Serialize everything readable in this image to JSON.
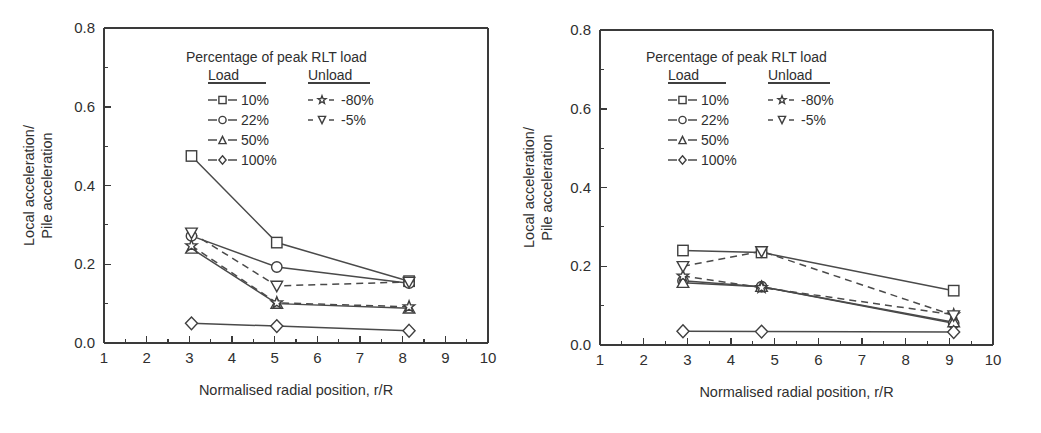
{
  "figure": {
    "background": "#ffffff",
    "line_color": "#4a4a4a",
    "marker_fill": "#ffffff",
    "marker_stroke": "#3f3f3f",
    "text_color": "#2f2f2f"
  },
  "legend": {
    "title": "Percentage of peak RLT load",
    "group_load_label": "Load",
    "group_unload_label": "Unload",
    "load_entries": [
      {
        "label": "10%",
        "marker": "square",
        "dash": false
      },
      {
        "label": "22%",
        "marker": "circle",
        "dash": false
      },
      {
        "label": "50%",
        "marker": "triangle-up",
        "dash": false
      },
      {
        "label": "100%",
        "marker": "diamond",
        "dash": false
      }
    ],
    "unload_entries": [
      {
        "label": "-80%",
        "marker": "star",
        "dash": true
      },
      {
        "label": "-5%",
        "marker": "triangle-down",
        "dash": true
      }
    ]
  },
  "chart_data": [
    {
      "type": "line",
      "title": "",
      "xlabel": "Normalised radial position, r/R",
      "ylabel": "Local acceleration/ Pile acceleration",
      "ylabel_line1": "Local acceleration/",
      "ylabel_line2": "Pile acceleration",
      "xlim": [
        1,
        10
      ],
      "ylim": [
        0.0,
        0.8
      ],
      "xticks": [
        1,
        2,
        3,
        4,
        5,
        6,
        7,
        8,
        9,
        10
      ],
      "xticklabels": [
        "1",
        "2",
        "3",
        "4",
        "5",
        "6",
        "7",
        "8",
        "9",
        "10"
      ],
      "xminor_step": 0.5,
      "yticks": [
        0.0,
        0.2,
        0.4,
        0.6,
        0.8
      ],
      "yticklabels": [
        "0.0",
        "0.2",
        "0.4",
        "0.6",
        "0.8"
      ],
      "yminor_step": 0.1,
      "grid": false,
      "legend_position": "top-right",
      "x": [
        3.05,
        5.05,
        8.15
      ],
      "series": [
        {
          "name": "10%",
          "marker": "square",
          "dash": false,
          "values": [
            0.475,
            0.255,
            0.157
          ]
        },
        {
          "name": "22%",
          "marker": "circle",
          "dash": false,
          "values": [
            0.272,
            0.193,
            0.152
          ]
        },
        {
          "name": "50%",
          "marker": "triangle-up",
          "dash": false,
          "values": [
            0.24,
            0.1,
            0.088
          ]
        },
        {
          "name": "100%",
          "marker": "diamond",
          "dash": false,
          "values": [
            0.05,
            0.043,
            0.031
          ]
        },
        {
          "name": "-80%",
          "marker": "star",
          "dash": true,
          "values": [
            0.247,
            0.102,
            0.092
          ]
        },
        {
          "name": "-5%",
          "marker": "triangle-down",
          "dash": true,
          "values": [
            0.28,
            0.145,
            0.155
          ]
        }
      ]
    },
    {
      "type": "line",
      "title": "",
      "xlabel": "Normalised radial position, r/R",
      "ylabel": "Local acceleration/ Pile acceleration",
      "ylabel_line1": "Local acceleration/",
      "ylabel_line2": "Pile acceleration",
      "xlim": [
        1,
        10
      ],
      "ylim": [
        0.0,
        0.8
      ],
      "xticks": [
        1,
        2,
        3,
        4,
        5,
        6,
        7,
        8,
        9,
        10
      ],
      "xticklabels": [
        "1",
        "2",
        "3",
        "4",
        "5",
        "6",
        "7",
        "8",
        "9",
        "10"
      ],
      "xminor_step": 0.5,
      "yticks": [
        0.0,
        0.2,
        0.4,
        0.6,
        0.8
      ],
      "yticklabels": [
        "0.0",
        "0.2",
        "0.4",
        "0.6",
        "0.8"
      ],
      "yminor_step": 0.1,
      "grid": false,
      "legend_position": "top-right",
      "x": [
        2.9,
        4.7,
        9.1
      ],
      "series": [
        {
          "name": "10%",
          "marker": "square",
          "dash": false,
          "values": [
            0.24,
            0.235,
            0.138
          ]
        },
        {
          "name": "22%",
          "marker": "circle",
          "dash": false,
          "values": [
            0.163,
            0.148,
            0.055
          ]
        },
        {
          "name": "50%",
          "marker": "triangle-up",
          "dash": false,
          "values": [
            0.158,
            0.148,
            0.058
          ]
        },
        {
          "name": "100%",
          "marker": "diamond",
          "dash": false,
          "values": [
            0.035,
            0.034,
            0.033
          ]
        },
        {
          "name": "-80%",
          "marker": "star",
          "dash": true,
          "values": [
            0.175,
            0.146,
            0.077
          ]
        },
        {
          "name": "-5%",
          "marker": "triangle-down",
          "dash": true,
          "values": [
            0.2,
            0.238,
            0.075
          ]
        }
      ]
    }
  ]
}
